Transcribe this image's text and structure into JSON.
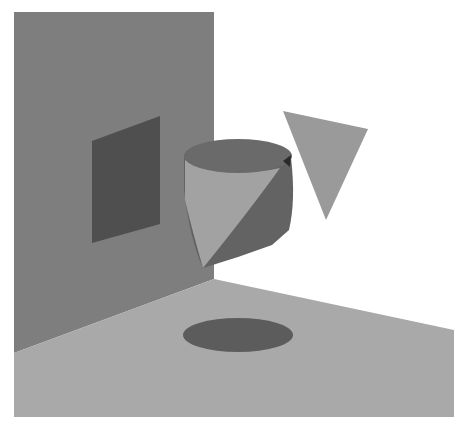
{
  "scene": {
    "description": "Grayscale 3D rendered scene: a back wall with a dark parallelogram, a floor with a dark elliptical shadow, a floating cylinder intersecting a cone, and a floating inverted triangle",
    "background": "#ffffff",
    "colors": {
      "wall": "#7e7e7e",
      "wall_panel": "#4f4f4f",
      "floor": "#a9a9a9",
      "floor_shadow": "#5c5c5c",
      "cylinder_top": "#6a6a6a",
      "cylinder_side": "#636363",
      "cone_light": "#a2a2a2",
      "triangle": "#9a9a9a"
    },
    "objects": [
      {
        "name": "back-wall"
      },
      {
        "name": "wall-panel"
      },
      {
        "name": "floor"
      },
      {
        "name": "floor-shadow-ellipse"
      },
      {
        "name": "cylinder"
      },
      {
        "name": "cone"
      },
      {
        "name": "floating-triangle"
      }
    ]
  }
}
